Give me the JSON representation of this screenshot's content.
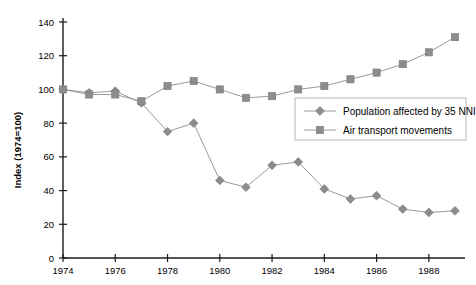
{
  "chart_data": {
    "type": "line",
    "title": "",
    "xlabel": "",
    "ylabel": "Index  (1974=100)",
    "xlim": [
      1974,
      1989
    ],
    "ylim": [
      0,
      140
    ],
    "ytick_values": [
      0,
      20,
      40,
      60,
      80,
      100,
      120,
      140
    ],
    "ytick_labels": [
      "0",
      "20",
      "40",
      "60",
      "80",
      "100",
      "120",
      "140"
    ],
    "xtick_values": [
      1974,
      1976,
      1978,
      1980,
      1982,
      1984,
      1986,
      1988
    ],
    "xtick_labels": [
      "1974",
      "1976",
      "1978",
      "1980",
      "1982",
      "1984",
      "1986",
      "1988"
    ],
    "x": [
      1974,
      1975,
      1976,
      1977,
      1978,
      1979,
      1980,
      1981,
      1982,
      1983,
      1984,
      1985,
      1986,
      1987,
      1988,
      1989
    ],
    "grid": false,
    "legend_position": "center-right",
    "series": [
      {
        "name": "Population affected by 35 NNI",
        "marker": "diamond",
        "color": "#8c8c8c",
        "values": [
          100,
          98,
          99,
          92,
          75,
          80,
          46,
          42,
          55,
          57,
          41,
          35,
          37,
          29,
          27,
          28
        ]
      },
      {
        "name": "Air transport movements",
        "marker": "square",
        "color": "#8c8c8c",
        "values": [
          100,
          97,
          97,
          93,
          102,
          105,
          100,
          95,
          96,
          100,
          102,
          106,
          110,
          115,
          122,
          131
        ]
      }
    ]
  },
  "legend": {
    "entries": [
      {
        "label": "Population affected by 35 NNI",
        "marker": "diamond"
      },
      {
        "label": "Air transport movements",
        "marker": "square"
      }
    ]
  },
  "axes": {
    "y_title": "Index  (1974=100)"
  }
}
